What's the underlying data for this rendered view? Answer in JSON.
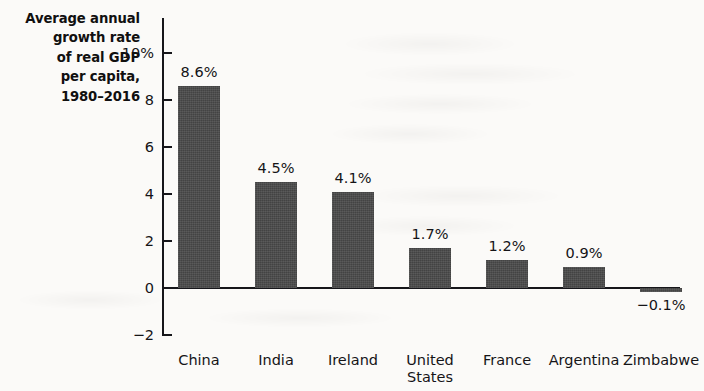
{
  "chart_data": {
    "type": "bar",
    "title": "Average annual growth rate of real GDP per capita, 1980–2016",
    "title_lines": [
      "Average annual",
      "growth rate",
      "of real GDP",
      "per capita,",
      "1980–2016"
    ],
    "xlabel": "",
    "ylabel": "Average annual growth rate of real GDP per capita, 1980–2016",
    "categories": [
      "China",
      "India",
      "Ireland",
      "United States",
      "France",
      "Argentina",
      "Zimbabwe"
    ],
    "category_lines": [
      [
        "China"
      ],
      [
        "India"
      ],
      [
        "Ireland"
      ],
      [
        "United",
        "States"
      ],
      [
        "France"
      ],
      [
        "Argentina"
      ],
      [
        "Zimbabwe"
      ]
    ],
    "values": [
      8.6,
      4.5,
      4.1,
      1.7,
      1.2,
      0.9,
      -0.1
    ],
    "value_labels": [
      "8.6%",
      "4.5%",
      "4.1%",
      "1.7%",
      "1.2%",
      "0.9%",
      "−0.1%"
    ],
    "ylim": [
      -2,
      10
    ],
    "yticks": [
      10,
      8,
      6,
      4,
      2,
      0,
      -2
    ],
    "ytick_labels": [
      "10%",
      "8",
      "6",
      "4",
      "2",
      "0",
      "−2"
    ],
    "grid": false,
    "legend": null,
    "bar_color": "#4a4a4a",
    "axis_color": "#16161a",
    "background_color": "#fbfaf8",
    "text_color": "#151417"
  }
}
